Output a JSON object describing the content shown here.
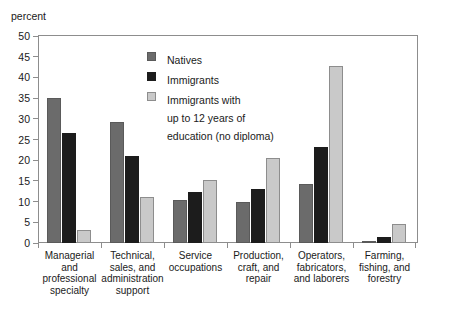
{
  "chart_data": {
    "type": "bar",
    "title": "",
    "subtitle": "",
    "xlabel": "",
    "ylabel": "percent",
    "ylim": [
      0,
      50
    ],
    "ytick_step": 5,
    "yticks": [
      50,
      45,
      40,
      35,
      30,
      25,
      20,
      15,
      10,
      5,
      0
    ],
    "grid": false,
    "legend_position": "inside-top-center",
    "categories": [
      "Managerial\nand\nprofessional\nspecialty",
      "Technical,\nsales, and\nadministration\nsupport",
      "Service\noccupations",
      "Production,\ncraft, and\nrepair",
      "Operators,\nfabricators,\nand laborers",
      "Farming,\nfishing, and\nforestry"
    ],
    "series": [
      {
        "name": "Natives",
        "color": "#6b6b6b",
        "values": [
          35.0,
          29.2,
          10.3,
          10.0,
          14.2,
          0.4
        ]
      },
      {
        "name": "Immigrants",
        "color": "#1c1c1c",
        "values": [
          26.6,
          21.1,
          12.3,
          13.0,
          23.3,
          1.5
        ]
      },
      {
        "name": "Immigrants with\nup to 12 years of\neducation (no diploma)",
        "color": "#c9c9c9",
        "values": [
          3.1,
          11.0,
          15.2,
          20.6,
          42.7,
          4.7
        ]
      }
    ]
  },
  "axis": {
    "unit_label": "percent"
  },
  "colors": {
    "natives": "#6b6b6b",
    "immigrants": "#1c1c1c",
    "low_education": "#c9c9c9",
    "frame": "#8d8d8d",
    "background": "#ffffff"
  }
}
